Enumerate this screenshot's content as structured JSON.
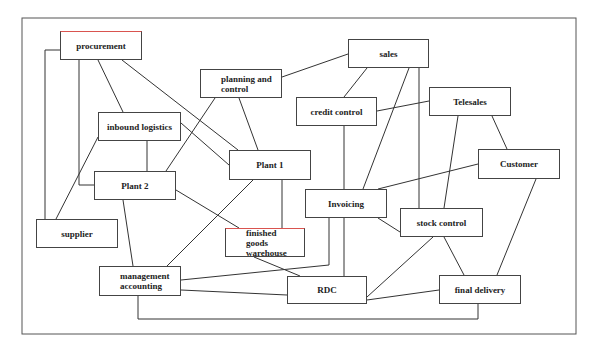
{
  "diagram": {
    "frame": {
      "x": 22,
      "y": 18,
      "w": 554,
      "h": 316
    },
    "nodes": [
      {
        "id": "procurement",
        "label": "procurement",
        "x": 60,
        "y": 31,
        "w": 82,
        "h": 29,
        "align": "center",
        "redtop": true
      },
      {
        "id": "planning",
        "label": "planning and\ncontrol",
        "x": 200,
        "y": 69,
        "w": 82,
        "h": 29,
        "align": "left",
        "redtop": false
      },
      {
        "id": "inbound",
        "label": "inbound logistics",
        "x": 98,
        "y": 112,
        "w": 83,
        "h": 29,
        "align": "center",
        "redtop": false
      },
      {
        "id": "plant1",
        "label": "Plant 1",
        "x": 229,
        "y": 150,
        "w": 82,
        "h": 30,
        "align": "center",
        "redtop": false
      },
      {
        "id": "sales",
        "label": "sales",
        "x": 348,
        "y": 39,
        "w": 81,
        "h": 29,
        "align": "center",
        "redtop": false
      },
      {
        "id": "credit",
        "label": "credit control",
        "x": 296,
        "y": 97,
        "w": 81,
        "h": 29,
        "align": "center",
        "redtop": false
      },
      {
        "id": "telesales",
        "label": "Telesales",
        "x": 429,
        "y": 87,
        "w": 82,
        "h": 29,
        "align": "center",
        "redtop": false
      },
      {
        "id": "customer",
        "label": "Customer",
        "x": 478,
        "y": 149,
        "w": 82,
        "h": 30,
        "align": "center",
        "redtop": false
      },
      {
        "id": "plant2",
        "label": "Plant 2",
        "x": 94,
        "y": 171,
        "w": 82,
        "h": 29,
        "align": "center",
        "redtop": false
      },
      {
        "id": "supplier",
        "label": "supplier",
        "x": 36,
        "y": 219,
        "w": 82,
        "h": 29,
        "align": "center",
        "redtop": false
      },
      {
        "id": "fgw",
        "label": "finished goods\nwarehouse",
        "x": 225,
        "y": 228,
        "w": 80,
        "h": 29,
        "align": "left",
        "redtop": true
      },
      {
        "id": "invoicing",
        "label": "Invoicing",
        "x": 305,
        "y": 189,
        "w": 82,
        "h": 29,
        "align": "center",
        "redtop": false
      },
      {
        "id": "stock",
        "label": "stock control",
        "x": 400,
        "y": 208,
        "w": 83,
        "h": 29,
        "align": "center",
        "redtop": false
      },
      {
        "id": "mgmt",
        "label": "management\naccounting",
        "x": 99,
        "y": 266,
        "w": 82,
        "h": 30,
        "align": "left",
        "redtop": false
      },
      {
        "id": "rdc",
        "label": "RDC",
        "x": 287,
        "y": 276,
        "w": 80,
        "h": 28,
        "align": "center",
        "redtop": false
      },
      {
        "id": "final",
        "label": "final delivery",
        "x": 439,
        "y": 275,
        "w": 82,
        "h": 29,
        "align": "center",
        "redtop": false
      }
    ],
    "edges": [
      {
        "from": "procurement",
        "to": "supplier",
        "points": [
          [
            60,
            50
          ],
          [
            45,
            50
          ],
          [
            45,
            219
          ]
        ]
      },
      {
        "from": "procurement",
        "to": "plant2",
        "points": [
          [
            79,
            60
          ],
          [
            79,
            185
          ],
          [
            94,
            185
          ]
        ]
      },
      {
        "from": "procurement",
        "to": "inbound",
        "points": [
          [
            98,
            60
          ],
          [
            123,
            112
          ]
        ]
      },
      {
        "from": "procurement",
        "to": "plant1",
        "points": [
          [
            122,
            60
          ],
          [
            238,
            150
          ]
        ]
      },
      {
        "from": "inbound",
        "to": "plant1",
        "points": [
          [
            181,
            123
          ],
          [
            229,
            165
          ]
        ]
      },
      {
        "from": "inbound",
        "to": "plant2",
        "points": [
          [
            147,
            141
          ],
          [
            147,
            171
          ]
        ]
      },
      {
        "from": "inbound",
        "to": "supplier",
        "points": [
          [
            98,
            137
          ],
          [
            56,
            219
          ]
        ]
      },
      {
        "from": "planning",
        "to": "plant2",
        "points": [
          [
            215,
            98
          ],
          [
            166,
            171
          ]
        ]
      },
      {
        "from": "planning",
        "to": "plant1",
        "points": [
          [
            239,
            98
          ],
          [
            258,
            150
          ]
        ]
      },
      {
        "from": "planning",
        "to": "sales",
        "points": [
          [
            282,
            77
          ],
          [
            348,
            54
          ]
        ]
      },
      {
        "from": "plant1",
        "to": "mgmt",
        "points": [
          [
            253,
            180
          ],
          [
            167,
            266
          ]
        ]
      },
      {
        "from": "plant1",
        "to": "fgw",
        "points": [
          [
            282,
            180
          ],
          [
            282,
            228
          ]
        ]
      },
      {
        "from": "plant2",
        "to": "fgw",
        "points": [
          [
            176,
            190
          ],
          [
            239,
            228
          ]
        ]
      },
      {
        "from": "plant2",
        "to": "mgmt",
        "points": [
          [
            123,
            200
          ],
          [
            133,
            266
          ]
        ]
      },
      {
        "from": "sales",
        "to": "credit",
        "points": [
          [
            367,
            68
          ],
          [
            344,
            97
          ]
        ]
      },
      {
        "from": "sales",
        "to": "invoicing",
        "points": [
          [
            409,
            68
          ],
          [
            363,
            189
          ]
        ]
      },
      {
        "from": "sales",
        "to": "stock",
        "points": [
          [
            419,
            68
          ],
          [
            419,
            208
          ]
        ]
      },
      {
        "from": "credit",
        "to": "telesales",
        "points": [
          [
            377,
            111
          ],
          [
            429,
            101
          ]
        ]
      },
      {
        "from": "credit",
        "to": "rdc",
        "points": [
          [
            344,
            126
          ],
          [
            344,
            276
          ]
        ]
      },
      {
        "from": "telesales",
        "to": "stock",
        "points": [
          [
            458,
            116
          ],
          [
            444,
            208
          ]
        ]
      },
      {
        "from": "telesales",
        "to": "customer",
        "points": [
          [
            492,
            116
          ],
          [
            507,
            149
          ]
        ]
      },
      {
        "from": "customer",
        "to": "invoicing",
        "points": [
          [
            478,
            164
          ],
          [
            378,
            189
          ]
        ]
      },
      {
        "from": "customer",
        "to": "final",
        "points": [
          [
            536,
            179
          ],
          [
            497,
            275
          ]
        ]
      },
      {
        "from": "invoicing",
        "to": "stock",
        "points": [
          [
            378,
            218
          ],
          [
            400,
            232
          ]
        ]
      },
      {
        "from": "invoicing",
        "to": "mgmt",
        "points": [
          [
            329,
            218
          ],
          [
            329,
            265
          ],
          [
            181,
            280
          ]
        ]
      },
      {
        "from": "fgw",
        "to": "rdc",
        "points": [
          [
            254,
            257
          ],
          [
            300,
            276
          ]
        ]
      },
      {
        "from": "stock",
        "to": "rdc",
        "points": [
          [
            433,
            237
          ],
          [
            367,
            297
          ]
        ]
      },
      {
        "from": "stock",
        "to": "final",
        "points": [
          [
            444,
            237
          ],
          [
            464,
            275
          ]
        ]
      },
      {
        "from": "rdc",
        "to": "final",
        "points": [
          [
            367,
            300
          ],
          [
            439,
            290
          ]
        ]
      },
      {
        "from": "mgmt",
        "to": "rdc",
        "points": [
          [
            181,
            290
          ],
          [
            287,
            295
          ]
        ]
      },
      {
        "from": "mgmt",
        "to": "final",
        "points": [
          [
            138,
            296
          ],
          [
            138,
            319
          ],
          [
            478,
            319
          ],
          [
            478,
            304
          ]
        ]
      }
    ],
    "colors": {
      "line": "#333333",
      "border": "#444444",
      "accent_red": "#d9534f",
      "background": "#ffffff"
    }
  }
}
